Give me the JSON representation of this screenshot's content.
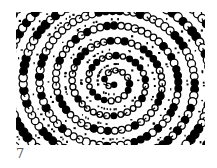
{
  "figure": {
    "colors": {
      "ink": "#000000",
      "paper": "#ffffff",
      "caption": "#555555"
    },
    "spiral": {
      "turns": 6,
      "center": [
        97,
        70
      ]
    }
  },
  "caption": {
    "label": "7"
  }
}
